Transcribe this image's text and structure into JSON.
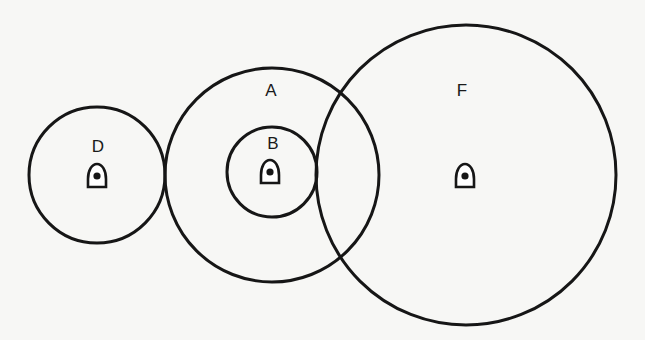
{
  "diagram": {
    "type": "coverage-circles",
    "circles": [
      {
        "id": "D",
        "label": "D",
        "cx": 97,
        "cy": 175,
        "r": 68,
        "label_x": 98,
        "label_y": 152,
        "icon_x": 97,
        "icon_y": 177
      },
      {
        "id": "A",
        "label": "A",
        "cx": 272,
        "cy": 175,
        "r": 107,
        "label_x": 271,
        "label_y": 96,
        "icon_x": null,
        "icon_y": null
      },
      {
        "id": "B",
        "label": "B",
        "cx": 272,
        "cy": 172,
        "r": 45,
        "label_x": 273,
        "label_y": 149,
        "icon_x": 270,
        "icon_y": 173
      },
      {
        "id": "F",
        "label": "F",
        "cx": 466,
        "cy": 175,
        "r": 150,
        "label_x": 462,
        "label_y": 96,
        "icon_x": 465,
        "icon_y": 177
      }
    ],
    "icon": "transmitter-icon",
    "stroke_color": "#161616",
    "background": "#f7f7f5"
  }
}
